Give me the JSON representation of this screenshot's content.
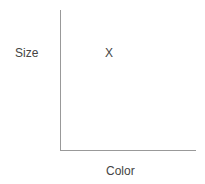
{
  "diagram": {
    "y_axis_label": "Size",
    "x_axis_label": "Color",
    "marker": "X",
    "axis_color": "#999999"
  }
}
